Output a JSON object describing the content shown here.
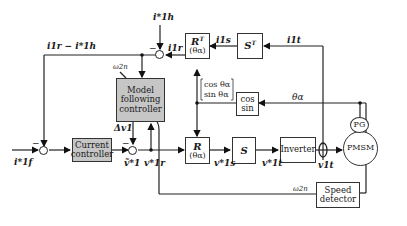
{
  "diagram": {
    "blocks": {
      "model_following_controller": "Model following controller",
      "current_controller": "Current controller",
      "rt_block": {
        "main": "R",
        "sup": "T",
        "arg": "(θα)"
      },
      "st_block": {
        "main": "S",
        "sup": "T"
      },
      "r_block": {
        "main": "R",
        "arg": "(θα)"
      },
      "s_block": {
        "main": "S"
      },
      "cos_sin_block": {
        "line1": "cos",
        "line2": "sin"
      },
      "inverter": "Inverter",
      "pmsm": "PMSM",
      "pg": "PG",
      "speed_detector": "Speed detector"
    },
    "signals": {
      "i1h_star": "i*1h",
      "i1r_minus_i1h": "i1r − i*1h",
      "i1r": "i1r",
      "i1s": "i1s",
      "i1t": "i1t",
      "omega2n_top": "ω2n",
      "theta_alpha": "θα",
      "cos_sin_vector": [
        "cos θα",
        "sin θα"
      ],
      "delta_v1": "Δv1",
      "i1f_star": "i*1f",
      "v1_tilde_star": "ṽ*1",
      "v1r_star": "v*1r",
      "v1s_star": "v*1s",
      "v1t_star": "v*1t",
      "v1t": "v1t",
      "omega2n_bottom": "ω2n"
    },
    "summing_signs": {
      "top": "−",
      "left": "−",
      "middle": "−"
    }
  }
}
